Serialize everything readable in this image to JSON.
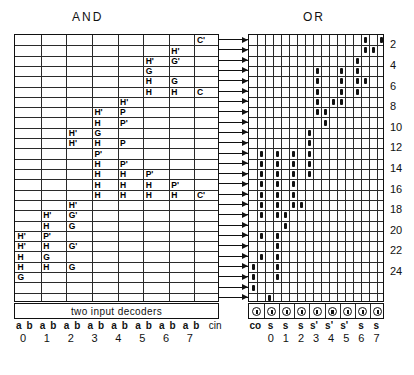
{
  "titles": {
    "and": "AND",
    "or": "OR"
  },
  "decoder": {
    "label": "two input decoders"
  },
  "and_plane": {
    "rows": 26,
    "cols": 8,
    "cells": [
      {
        "r": 0,
        "c": 7,
        "t": "C'"
      },
      {
        "r": 1,
        "c": 6,
        "t": "H'"
      },
      {
        "r": 2,
        "c": 5,
        "t": "H'"
      },
      {
        "r": 2,
        "c": 6,
        "t": "G'"
      },
      {
        "r": 3,
        "c": 5,
        "t": "G"
      },
      {
        "r": 4,
        "c": 5,
        "t": "H"
      },
      {
        "r": 4,
        "c": 6,
        "t": "G"
      },
      {
        "r": 5,
        "c": 5,
        "t": "H"
      },
      {
        "r": 5,
        "c": 6,
        "t": "H"
      },
      {
        "r": 5,
        "c": 7,
        "t": "C"
      },
      {
        "r": 6,
        "c": 4,
        "t": "H'"
      },
      {
        "r": 7,
        "c": 3,
        "t": "H'"
      },
      {
        "r": 7,
        "c": 4,
        "t": "P"
      },
      {
        "r": 8,
        "c": 3,
        "t": "H"
      },
      {
        "r": 8,
        "c": 4,
        "t": "P'"
      },
      {
        "r": 9,
        "c": 2,
        "t": "H'"
      },
      {
        "r": 9,
        "c": 3,
        "t": "G"
      },
      {
        "r": 10,
        "c": 2,
        "t": "H'"
      },
      {
        "r": 10,
        "c": 3,
        "t": "H"
      },
      {
        "r": 10,
        "c": 4,
        "t": "P"
      },
      {
        "r": 11,
        "c": 3,
        "t": "P'"
      },
      {
        "r": 12,
        "c": 3,
        "t": "H"
      },
      {
        "r": 12,
        "c": 4,
        "t": "P'"
      },
      {
        "r": 13,
        "c": 3,
        "t": "H"
      },
      {
        "r": 13,
        "c": 4,
        "t": "H"
      },
      {
        "r": 13,
        "c": 5,
        "t": "P'"
      },
      {
        "r": 14,
        "c": 3,
        "t": "H"
      },
      {
        "r": 14,
        "c": 4,
        "t": "H"
      },
      {
        "r": 14,
        "c": 5,
        "t": "H"
      },
      {
        "r": 14,
        "c": 6,
        "t": "P'"
      },
      {
        "r": 15,
        "c": 3,
        "t": "H"
      },
      {
        "r": 15,
        "c": 4,
        "t": "H"
      },
      {
        "r": 15,
        "c": 5,
        "t": "H"
      },
      {
        "r": 15,
        "c": 6,
        "t": "H"
      },
      {
        "r": 15,
        "c": 7,
        "t": "C'"
      },
      {
        "r": 16,
        "c": 2,
        "t": "H'"
      },
      {
        "r": 17,
        "c": 1,
        "t": "H'"
      },
      {
        "r": 17,
        "c": 2,
        "t": "G'"
      },
      {
        "r": 18,
        "c": 1,
        "t": "H"
      },
      {
        "r": 18,
        "c": 2,
        "t": "G"
      },
      {
        "r": 19,
        "c": 0,
        "t": "H'"
      },
      {
        "r": 19,
        "c": 1,
        "t": "P'"
      },
      {
        "r": 20,
        "c": 0,
        "t": "H'"
      },
      {
        "r": 20,
        "c": 1,
        "t": "H"
      },
      {
        "r": 20,
        "c": 2,
        "t": "G'"
      },
      {
        "r": 21,
        "c": 0,
        "t": "H"
      },
      {
        "r": 21,
        "c": 1,
        "t": "G"
      },
      {
        "r": 22,
        "c": 0,
        "t": "H"
      },
      {
        "r": 22,
        "c": 1,
        "t": "H"
      },
      {
        "r": 22,
        "c": 2,
        "t": "G"
      },
      {
        "r": 23,
        "c": 0,
        "t": "G"
      }
    ],
    "inputs": [
      "a",
      "b",
      "a",
      "b",
      "a",
      "b",
      "a",
      "b",
      "a",
      "b",
      "a",
      "b",
      "a",
      "b",
      "a",
      "b"
    ],
    "input_groups": [
      "0",
      "1",
      "2",
      "3",
      "4",
      "5",
      "6",
      "7"
    ],
    "cin_label": "cin"
  },
  "or_plane": {
    "rows": 26,
    "cols": 17,
    "marks": [
      {
        "r": 0,
        "c": 14
      },
      {
        "r": 0,
        "c": 16
      },
      {
        "r": 1,
        "c": 14
      },
      {
        "r": 1,
        "c": 15
      },
      {
        "r": 2,
        "c": 13
      },
      {
        "r": 3,
        "c": 8
      },
      {
        "r": 3,
        "c": 11
      },
      {
        "r": 3,
        "c": 13
      },
      {
        "r": 4,
        "c": 8
      },
      {
        "r": 4,
        "c": 11
      },
      {
        "r": 4,
        "c": 13
      },
      {
        "r": 4,
        "c": 14
      },
      {
        "r": 5,
        "c": 8
      },
      {
        "r": 5,
        "c": 11
      },
      {
        "r": 5,
        "c": 13
      },
      {
        "r": 6,
        "c": 8
      },
      {
        "r": 6,
        "c": 10
      },
      {
        "r": 6,
        "c": 11
      },
      {
        "r": 7,
        "c": 8
      },
      {
        "r": 7,
        "c": 9
      },
      {
        "r": 8,
        "c": 9
      },
      {
        "r": 9,
        "c": 7
      },
      {
        "r": 10,
        "c": 7
      },
      {
        "r": 11,
        "c": 1
      },
      {
        "r": 11,
        "c": 3
      },
      {
        "r": 11,
        "c": 5
      },
      {
        "r": 11,
        "c": 7
      },
      {
        "r": 12,
        "c": 1
      },
      {
        "r": 12,
        "c": 3
      },
      {
        "r": 12,
        "c": 5
      },
      {
        "r": 12,
        "c": 7
      },
      {
        "r": 13,
        "c": 1
      },
      {
        "r": 13,
        "c": 3
      },
      {
        "r": 13,
        "c": 5
      },
      {
        "r": 13,
        "c": 7
      },
      {
        "r": 14,
        "c": 1
      },
      {
        "r": 14,
        "c": 3
      },
      {
        "r": 14,
        "c": 5
      },
      {
        "r": 15,
        "c": 1
      },
      {
        "r": 15,
        "c": 3
      },
      {
        "r": 15,
        "c": 5
      },
      {
        "r": 16,
        "c": 1
      },
      {
        "r": 16,
        "c": 3
      },
      {
        "r": 16,
        "c": 5
      },
      {
        "r": 16,
        "c": 6
      },
      {
        "r": 17,
        "c": 1
      },
      {
        "r": 17,
        "c": 3
      },
      {
        "r": 17,
        "c": 4
      },
      {
        "r": 18,
        "c": 4
      },
      {
        "r": 19,
        "c": 1
      },
      {
        "r": 19,
        "c": 3
      },
      {
        "r": 20,
        "c": 3
      },
      {
        "r": 21,
        "c": 1
      },
      {
        "r": 21,
        "c": 3
      },
      {
        "r": 22,
        "c": 0
      },
      {
        "r": 22,
        "c": 3
      },
      {
        "r": 23,
        "c": 0
      },
      {
        "r": 23,
        "c": 3
      },
      {
        "r": 24,
        "c": 0
      },
      {
        "r": 25,
        "c": 2
      }
    ],
    "outputs": [
      "co",
      "s",
      "s",
      "s",
      "s'",
      "s'",
      "s'",
      "s",
      "s"
    ],
    "output_nums": [
      "0",
      "1",
      "2",
      "3",
      "4",
      "5",
      "6",
      "7"
    ]
  },
  "row_numbers": [
    "2",
    "4",
    "6",
    "8",
    "10",
    "12",
    "14",
    "16",
    "18",
    "20",
    "22",
    "24"
  ],
  "colors": {
    "ink": "#111111",
    "grid": "#2a2a2a",
    "paper": "#ffffff"
  }
}
